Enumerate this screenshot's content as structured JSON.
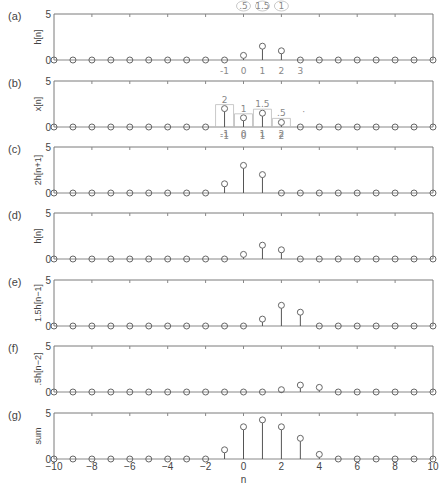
{
  "chart_data": {
    "type": "stem",
    "x": [
      -10,
      -9,
      -8,
      -7,
      -6,
      -5,
      -4,
      -3,
      -2,
      -1,
      0,
      1,
      2,
      3,
      4,
      5,
      6,
      7,
      8,
      9,
      10
    ],
    "xlim": [
      -10,
      10
    ],
    "ylim": [
      0,
      5
    ],
    "xlabel": "n",
    "xticks": [
      -10,
      -8,
      -6,
      -4,
      -2,
      0,
      2,
      4,
      6,
      8,
      10
    ],
    "yticks": [
      0,
      5
    ],
    "panels": [
      {
        "tag": "(a)",
        "ylabel": "h[n]",
        "values": {
          "0": 0.5,
          "1": 1.5,
          "2": 1
        }
      },
      {
        "tag": "(b)",
        "ylabel": "x[n]",
        "values": {
          "-1": 2,
          "0": 1,
          "1": 1.5,
          "2": 0.5
        }
      },
      {
        "tag": "(c)",
        "ylabel": "2h[n+1]",
        "values": {
          "-1": 1,
          "0": 3,
          "1": 2
        }
      },
      {
        "tag": "(d)",
        "ylabel": "h[n]",
        "values": {
          "0": 0.5,
          "1": 1.5,
          "2": 1
        }
      },
      {
        "tag": "(e)",
        "ylabel": "1.5h[n−1]",
        "values": {
          "1": 0.75,
          "2": 2.25,
          "3": 1.5
        }
      },
      {
        "tag": "(f)",
        "ylabel": ".5h[n−2]",
        "values": {
          "2": 0.25,
          "3": 0.75,
          "4": 0.5
        }
      },
      {
        "tag": "(g)",
        "ylabel": "sum",
        "values": {
          "-1": 1,
          "0": 3.5,
          "1": 4.25,
          "2": 3.5,
          "3": 2.25,
          "4": 0.5
        }
      }
    ],
    "annotations": {
      "a_top": [
        ".5",
        "1.5",
        "1"
      ],
      "a_below": [
        "-1",
        "0",
        "1",
        "2",
        "3"
      ],
      "b_above": {
        "-1": "2",
        "0": "1",
        "1": "1.5",
        "2": ".5"
      },
      "b_below": [
        "-1",
        "0",
        "1",
        "2"
      ],
      "c_above": [
        "-1",
        "0",
        "1",
        "2"
      ]
    }
  },
  "labels": {
    "xlabel": "n",
    "ytop": "5",
    "ybottom": "0"
  }
}
